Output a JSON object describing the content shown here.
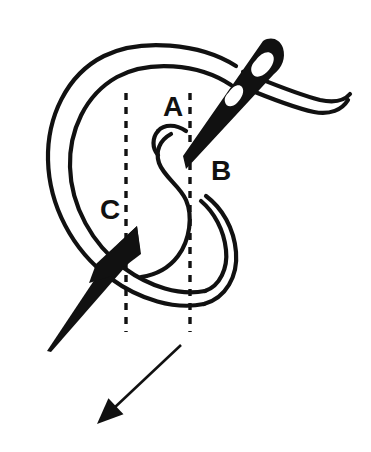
{
  "figure": {
    "kind": "embroidery-stitch-diagram",
    "background_color": "#ffffff",
    "ink_color": "#111111",
    "width": 371,
    "height": 452
  },
  "labels": [
    {
      "id": "A",
      "text": "A",
      "x": 173,
      "y": 109,
      "description": "needle exit point at top of stitch"
    },
    {
      "id": "B",
      "text": "B",
      "x": 221,
      "y": 173,
      "description": "needle re-entry point beside A"
    },
    {
      "id": "C",
      "text": "C",
      "x": 110,
      "y": 212,
      "description": "needle emergence point lower left"
    }
  ],
  "guides": {
    "dashed_color": "#111111",
    "dash_pattern": "7 7",
    "stroke_width": 3.4,
    "lines": [
      {
        "id": "guide-left",
        "x": 126,
        "y1": 93,
        "y2": 332
      },
      {
        "id": "guide-right",
        "x": 190,
        "y1": 93,
        "y2": 332
      }
    ]
  },
  "arrow": {
    "id": "direction-arrow",
    "description": "pull direction arrow pointing down-left",
    "from_x": 181,
    "from_y": 345,
    "to_x": 97,
    "to_y": 424,
    "stroke_width": 2.6,
    "head_length": 26,
    "head_width": 22
  },
  "needles": [
    {
      "id": "upper-needle",
      "description": "needle entering at B and exiting upper right, carrying thread through its eye",
      "tip_x": 186,
      "tip_y": 168,
      "butt_x": 281,
      "butt_y": 47,
      "eye_visible": true
    },
    {
      "id": "lower-needle",
      "description": "needle emerging at C pointing down-left",
      "tip_x": 47,
      "tip_y": 351,
      "butt_x": 137,
      "butt_y": 227
    }
  ],
  "threads": [
    {
      "id": "outer-loop",
      "description": "large open thread loop sweeping left from the needle eye around to point C"
    },
    {
      "id": "inner-s-curve",
      "description": "S shaped thread curve descending from A through the loop"
    },
    {
      "id": "bottom-loop",
      "description": "rounded bottom of the working loop below C"
    },
    {
      "id": "tail-thread",
      "description": "free thread tail passing out of the needle eye to the right"
    }
  ]
}
